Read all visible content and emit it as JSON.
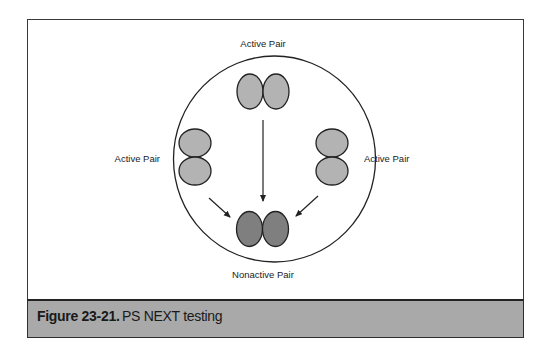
{
  "diagram": {
    "labels": {
      "top": "Active Pair",
      "left": "Active Pair",
      "right": "Active Pair",
      "bottom": "Nonactive Pair"
    },
    "colors": {
      "active_fill": "#b3b3b3",
      "nonactive_fill": "#7f7f7f",
      "stroke": "#222222",
      "caption_bg": "#a9a9a9"
    },
    "nodes": [
      {
        "id": "top-pair",
        "type": "active",
        "orientation": "horizontal"
      },
      {
        "id": "left-pair",
        "type": "active",
        "orientation": "vertical"
      },
      {
        "id": "right-pair",
        "type": "active",
        "orientation": "vertical"
      },
      {
        "id": "bottom-pair",
        "type": "nonactive",
        "orientation": "horizontal"
      }
    ],
    "edges": [
      {
        "from": "top-pair",
        "to": "bottom-pair"
      },
      {
        "from": "left-pair",
        "to": "bottom-pair"
      },
      {
        "from": "right-pair",
        "to": "bottom-pair"
      }
    ]
  },
  "caption": {
    "number": "Figure 23-21.",
    "text": "PS NEXT testing"
  }
}
